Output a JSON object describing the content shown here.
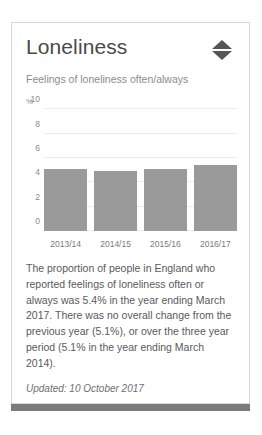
{
  "card": {
    "title": "Loneliness",
    "subtitle": "Feelings of loneliness often/always",
    "sort_icon": "sort-diamond-icon",
    "body_text": "The proportion of people in England who reported feelings of loneliness often or always was 5.4% in the year ending March 2017. There was no overall change from the previous year (5.1%), or over the three year period (5.1% in the year ending March 2014).",
    "updated": "Updated: 10 October 2017"
  },
  "colors": {
    "bar": "#9a9a9a",
    "title": "#4a4a4a",
    "muted": "#8c8c8c",
    "border": "#d8d8d8",
    "scrollbar": "#7c7c7c"
  },
  "chart_data": {
    "type": "bar",
    "title": "Feelings of loneliness often/always",
    "categories": [
      "2013/14",
      "2014/15",
      "2015/16",
      "2016/17"
    ],
    "values": [
      5.1,
      4.9,
      5.1,
      5.4
    ],
    "xlabel": "",
    "ylabel": "%",
    "unit": "%",
    "ylim": [
      0,
      10
    ],
    "yticks": [
      10,
      8,
      6,
      4,
      2,
      0
    ],
    "grid": true,
    "legend": false,
    "series_color": "#9a9a9a"
  }
}
